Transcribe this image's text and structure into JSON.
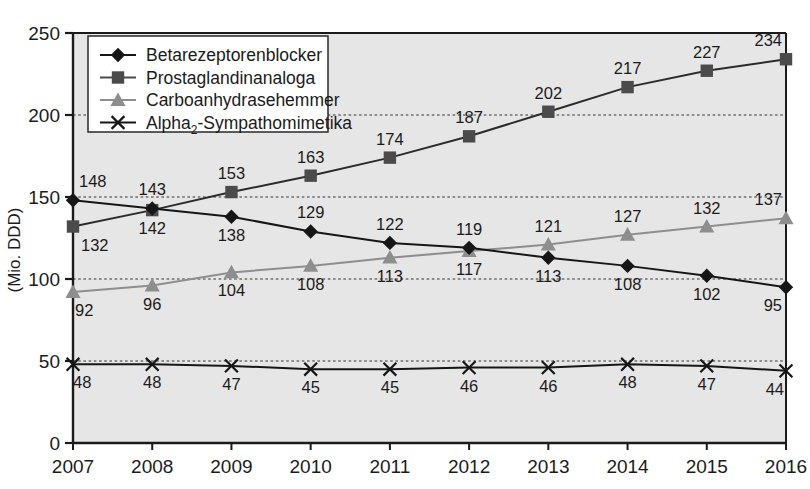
{
  "chart_data": {
    "type": "line",
    "title": "",
    "subtitle": "",
    "xlabel": "",
    "ylabel": "(Mio. DDD)",
    "grid": true,
    "legend_position": "top-left",
    "xlim": [
      2007,
      2016
    ],
    "ylim": [
      0,
      250
    ],
    "yticks": [
      0,
      50,
      100,
      150,
      200,
      250
    ],
    "ytick_labels": [
      "0",
      "50",
      "100",
      "150",
      "200",
      "250"
    ],
    "categories": [
      "2007",
      "2008",
      "2009",
      "2010",
      "2011",
      "2012",
      "2013",
      "2014",
      "2015",
      "2016"
    ],
    "series": [
      {
        "name": "Betarezeptorenblocker",
        "marker": "diamond",
        "color": "#161616",
        "line_color": "#161616",
        "values": [
          148,
          143,
          138,
          129,
          122,
          119,
          113,
          108,
          102,
          95
        ],
        "label_positions": [
          "above",
          "above",
          "below",
          "above",
          "above",
          "above",
          "below",
          "below",
          "below",
          "below"
        ]
      },
      {
        "name": "Prostaglandinanaloga",
        "marker": "square",
        "color": "#4b4b4b",
        "line_color": "#2b2b2b",
        "values": [
          132,
          142,
          153,
          163,
          174,
          187,
          202,
          217,
          227,
          234
        ],
        "label_positions": [
          "below",
          "below",
          "above",
          "above",
          "above",
          "above",
          "above",
          "above",
          "above",
          "above"
        ]
      },
      {
        "name": "Carboanhydrasehemmer",
        "marker": "triangle",
        "color": "#8e8e8e",
        "line_color": "#8e8e8e",
        "values": [
          92,
          96,
          104,
          108,
          113,
          117,
          121,
          127,
          132,
          137
        ],
        "label_positions": [
          "below",
          "below",
          "below",
          "below",
          "below",
          "below",
          "above",
          "above",
          "above",
          "above"
        ]
      },
      {
        "name": "Alpha₂-Sympathomimetika",
        "marker": "cross",
        "color": "#161616",
        "line_color": "#161616",
        "values": [
          48,
          48,
          47,
          45,
          45,
          46,
          46,
          48,
          47,
          44
        ],
        "label_positions": [
          "below",
          "below",
          "below",
          "below",
          "below",
          "below",
          "below",
          "below",
          "below",
          "below"
        ]
      }
    ],
    "colors": {
      "plot_background": "#e6e6e6",
      "grid": "#6f6f6f",
      "axis": "#1b1b1b",
      "page_background": "#ffffff"
    }
  },
  "legend": {
    "items": [
      {
        "label": "Betarezeptorenblocker",
        "marker": "diamond",
        "color": "#161616"
      },
      {
        "label": "Prostaglandinanaloga",
        "marker": "square",
        "color": "#4b4b4b"
      },
      {
        "label": "Carboanhydrasehemmer",
        "marker": "triangle",
        "color": "#8e8e8e"
      },
      {
        "label": "Alpha",
        "label_sub": "2",
        "label_rest": "-Sympathomimetika",
        "marker": "cross",
        "color": "#161616"
      }
    ]
  },
  "axes": {
    "y_title": "(Mio. DDD)",
    "y_ticks": [
      "250",
      "200",
      "150",
      "100",
      "50",
      "0"
    ],
    "x_ticks": [
      "2007",
      "2008",
      "2009",
      "2010",
      "2011",
      "2012",
      "2013",
      "2014",
      "2015",
      "2016"
    ]
  }
}
